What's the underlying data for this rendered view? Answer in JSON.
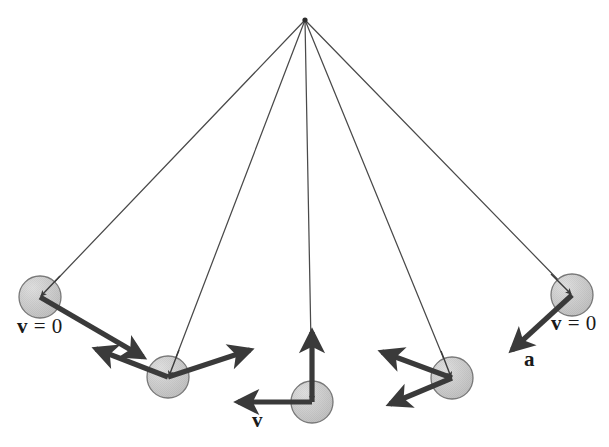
{
  "figure": {
    "type": "physics-vector-diagram",
    "background_color": "#ffffff",
    "pivot": {
      "x": 305,
      "y": 20,
      "label": ""
    },
    "colors": {
      "string": "#4a4a4a",
      "bob_fill": "#c9c9c9",
      "bob_edge": "#6e6e6e",
      "bob_highlight": "#e8e8e8",
      "vector": "#3a3a3a",
      "text": "#1a1a1a"
    },
    "bob_radius": 21
  },
  "bobs": [
    {
      "id": "bob-1-left-extreme",
      "cx": 40,
      "cy": 297,
      "position": "left extreme"
    },
    {
      "id": "bob-2-left-mid",
      "cx": 168,
      "cy": 377,
      "position": "left middle"
    },
    {
      "id": "bob-3-bottom",
      "cx": 312,
      "cy": 402,
      "position": "bottom center"
    },
    {
      "id": "bob-4-right-mid",
      "cx": 452,
      "cy": 378,
      "position": "right middle"
    },
    {
      "id": "bob-5-right-extreme",
      "cx": 572,
      "cy": 295,
      "position": "right extreme"
    }
  ],
  "strings": [
    {
      "id": "string-1",
      "x1": 305,
      "y1": 20,
      "x2": 40,
      "y2": 297
    },
    {
      "id": "string-2",
      "x1": 305,
      "y1": 20,
      "x2": 168,
      "y2": 377
    },
    {
      "id": "string-3",
      "x1": 305,
      "y1": 20,
      "x2": 312,
      "y2": 402
    },
    {
      "id": "string-4",
      "x1": 305,
      "y1": 20,
      "x2": 452,
      "y2": 378
    },
    {
      "id": "string-5",
      "x1": 305,
      "y1": 20,
      "x2": 572,
      "y2": 295
    }
  ],
  "vectors": [
    {
      "id": "accel-1",
      "kind": "acceleration",
      "bob": "bob-1-left-extreme",
      "x1": 40,
      "y1": 297,
      "x2": 143,
      "y2": 357,
      "label": "a",
      "note": "tangential acceleration at left extreme, points down-right"
    },
    {
      "id": "vel-2",
      "kind": "velocity",
      "bob": "bob-2-left-mid",
      "x1": 168,
      "y1": 377,
      "x2": 250,
      "y2": 350,
      "label": "v",
      "note": "velocity at left middle, points up-right along tangent"
    },
    {
      "id": "accel-2",
      "kind": "acceleration",
      "bob": "bob-2-left-mid",
      "x1": 168,
      "y1": 377,
      "x2": 96,
      "y2": 349,
      "label": "a",
      "note": "acceleration at left middle, points up-left"
    },
    {
      "id": "accel-3",
      "kind": "acceleration",
      "bob": "bob-3-bottom",
      "x1": 312,
      "y1": 402,
      "x2": 312,
      "y2": 332,
      "label": "a",
      "note": "centripetal acceleration at lowest point, points straight up"
    },
    {
      "id": "vel-3",
      "kind": "velocity",
      "bob": "bob-3-bottom",
      "x1": 312,
      "y1": 402,
      "x2": 238,
      "y2": 402,
      "label": "v",
      "note": "maximum velocity at lowest point, points left"
    },
    {
      "id": "vel-4",
      "kind": "velocity",
      "bob": "bob-4-right-mid",
      "x1": 452,
      "y1": 378,
      "x2": 382,
      "y2": 352,
      "label": "v",
      "note": "velocity at right middle, points up-left along tangent"
    },
    {
      "id": "accel-4",
      "kind": "acceleration",
      "bob": "bob-4-right-mid",
      "x1": 452,
      "y1": 378,
      "x2": 390,
      "y2": 404,
      "label": "a",
      "note": "acceleration at right middle, points down-left"
    },
    {
      "id": "accel-5",
      "kind": "acceleration",
      "bob": "bob-5-right-extreme",
      "x1": 572,
      "y1": 295,
      "x2": 512,
      "y2": 350,
      "label": "a",
      "note": "tangential acceleration at right extreme, points down-left"
    }
  ],
  "labels": [
    {
      "id": "label-v-zero-left",
      "text": "v = 0",
      "symbol": "v",
      "equals": "=",
      "value": "0",
      "x": 17,
      "y": 316,
      "describes": "bob-1-left-extreme"
    },
    {
      "id": "label-v-bottom",
      "text": "v",
      "symbol": "v",
      "equals": "",
      "value": "",
      "x": 252,
      "y": 410,
      "describes": "vel-3"
    },
    {
      "id": "label-v-zero-right",
      "text": "v = 0",
      "symbol": "v",
      "equals": "=",
      "value": "0",
      "x": 551,
      "y": 313,
      "describes": "bob-5-right-extreme"
    },
    {
      "id": "label-a-right",
      "text": "a",
      "symbol": "a",
      "equals": "",
      "value": "",
      "x": 524,
      "y": 349,
      "describes": "accel-5"
    }
  ]
}
